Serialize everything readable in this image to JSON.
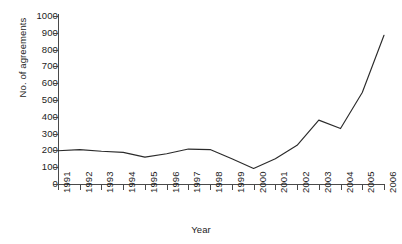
{
  "chart_data": {
    "type": "line",
    "title": "",
    "xlabel": "Year",
    "ylabel": "No. of agreements",
    "categories": [
      "1991",
      "1992",
      "1993",
      "1994",
      "1995",
      "1996",
      "1997",
      "1998",
      "1999",
      "2000",
      "2001",
      "2002",
      "2003",
      "2004",
      "2005",
      "2006"
    ],
    "values": [
      198,
      205,
      195,
      188,
      160,
      180,
      208,
      205,
      150,
      92,
      150,
      230,
      380,
      330,
      545,
      885
    ],
    "series": [
      {
        "name": "No. of agreements",
        "values": [
          198,
          205,
          195,
          188,
          160,
          180,
          208,
          205,
          150,
          92,
          150,
          230,
          380,
          330,
          545,
          885
        ]
      }
    ],
    "xlim": [
      "1991",
      "2006"
    ],
    "ylim": [
      0,
      1000
    ],
    "ytick_labels": [
      "0",
      "100",
      "200",
      "300",
      "400",
      "500",
      "600",
      "700",
      "800",
      "900",
      "1000"
    ],
    "ytick_values": [
      0,
      100,
      200,
      300,
      400,
      500,
      600,
      700,
      800,
      900,
      1000
    ],
    "xtick_labels": [
      "1991",
      "1992",
      "1993",
      "1994",
      "1995",
      "1996",
      "1997",
      "1998",
      "1999",
      "2000",
      "2001",
      "2002",
      "2003",
      "2004",
      "2005",
      "2006"
    ],
    "grid": false,
    "legend": false,
    "legend_position": "none",
    "line_color": "#2b2b2b",
    "axis_color": "#4a4a4a",
    "background_color": "#ffffff",
    "markers": false,
    "xtick_rotation": -90
  }
}
